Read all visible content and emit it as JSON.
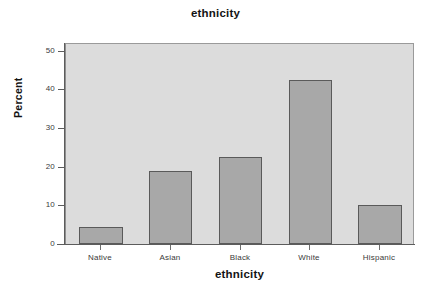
{
  "chart_data": {
    "type": "bar",
    "title": "ethnicity",
    "xlabel": "ethnicity",
    "ylabel": "Percent",
    "categories": [
      "Native",
      "Asian",
      "Black",
      "White",
      "Hispanic"
    ],
    "values": [
      4.5,
      18.8,
      22.5,
      42.5,
      10.2
    ],
    "ytick_labels": [
      "0",
      "10",
      "20",
      "30",
      "40",
      "50"
    ],
    "ytick_values": [
      0,
      10,
      20,
      30,
      40,
      50
    ],
    "ylim": [
      0,
      52
    ],
    "grid": false,
    "legend": "none",
    "bar_fill_color": "#a8a8a8",
    "bar_edge_color": "#5a5a5a",
    "plot_background_color": "#dcdcdc",
    "figure_background_color": "#ffffff"
  }
}
